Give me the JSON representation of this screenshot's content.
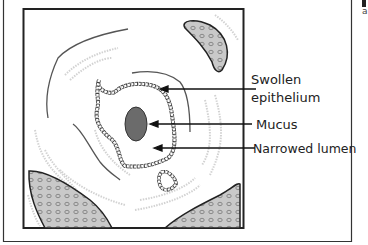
{
  "figure": {
    "type": "cross-section diagram",
    "labels": [
      {
        "id": "swollen-epithelium",
        "line1": "Swollen",
        "line2": "epithelium"
      },
      {
        "id": "mucus",
        "line1": "Mucus"
      },
      {
        "id": "narrowed-lumen",
        "line1": "Narrowed lumen"
      }
    ],
    "colors": {
      "frame": "#222222",
      "tissue_fill": "#c9c9c9",
      "mucus_fill": "#6b6b6b",
      "wavy_line": "#555555",
      "faint_line": "#cfcfcf"
    }
  },
  "side_text": {
    "letter": "a"
  }
}
